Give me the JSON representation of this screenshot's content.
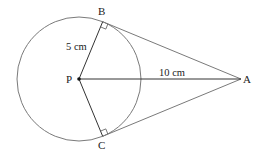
{
  "diagram": {
    "points": {
      "P": {
        "label": "P",
        "x": 79,
        "y": 79
      },
      "A": {
        "label": "A",
        "x": 241,
        "y": 79
      },
      "B": {
        "label": "B",
        "x": 102.7,
        "y": 21.7
      },
      "C": {
        "label": "C",
        "x": 102.7,
        "y": 136.3
      }
    },
    "circle": {
      "center": "P",
      "radius_px": 62
    },
    "measurements": {
      "radius_label": "5 cm",
      "pa_label": "10 cm"
    },
    "right_angles": [
      "B",
      "C"
    ],
    "colors": {
      "circle": "#7a7a7a",
      "tangent": "#7a7a7a",
      "radius": "#333333",
      "text": "#222222"
    }
  }
}
